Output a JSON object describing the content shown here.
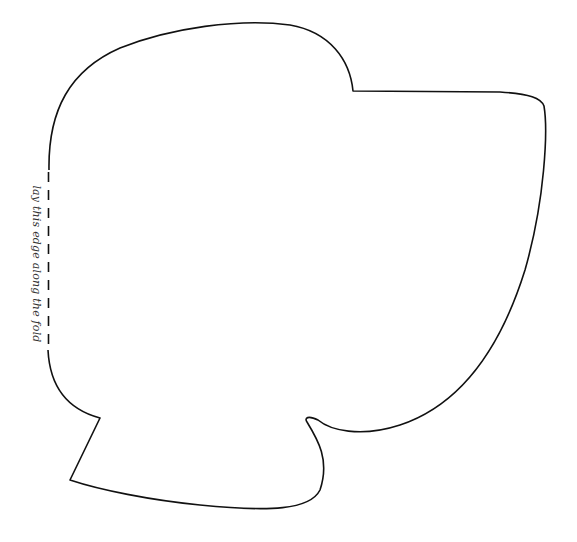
{
  "pattern": {
    "fold_label": "lay this edge along the fold",
    "outline_color": "#111111",
    "background": "#ffffff"
  }
}
